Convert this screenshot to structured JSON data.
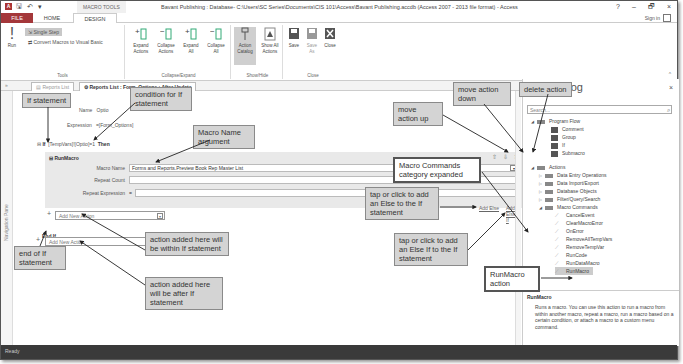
{
  "window": {
    "title": "Bavant Publishing : Database- C:\\Users\\SC Series\\Documents\\CIS 101\\Access\\Bavant Publishing.accdb (Access 2007 - 2013 file format) - Access",
    "context_tab": "MACRO TOOLS",
    "controls": {
      "help": "?",
      "minimize": "–",
      "restore": "🗗",
      "close": "×"
    },
    "sign_in": "Sign in"
  },
  "ribbon": {
    "tabs": [
      "FILE",
      "HOME",
      "DESIGN"
    ],
    "groups": {
      "tools": {
        "label": "Tools",
        "run": "Run",
        "single_step": "Single Step",
        "convert": "Convert Macros to Visual Basic"
      },
      "collapse_expand": {
        "label": "Collapse/Expand",
        "buttons": [
          {
            "line1": "Expand",
            "line2": "Actions"
          },
          {
            "line1": "Collapse",
            "line2": "Actions"
          },
          {
            "line1": "Expand",
            "line2": "All"
          },
          {
            "line1": "Collapse",
            "line2": "All"
          }
        ]
      },
      "show_hide": {
        "label": "Show/Hide",
        "buttons": [
          {
            "line1": "Action",
            "line2": "Catalog"
          },
          {
            "line1": "Show All",
            "line2": "Actions"
          }
        ]
      },
      "close": {
        "label": "Close",
        "buttons": [
          {
            "line1": "Save",
            "line2": ""
          },
          {
            "line1": "Save",
            "line2": "As"
          },
          {
            "line1": "Close",
            "line2": ""
          }
        ]
      }
    }
  },
  "doc_tabs": [
    {
      "label": "Reports List",
      "active": false
    },
    {
      "label": "Reports List : Form_Options : After Update",
      "active": true
    }
  ],
  "nav_pane": {
    "label": "Navigation Pane"
  },
  "designer": {
    "name_label": "Name",
    "name_value": "Optio",
    "expression_label": "Expression",
    "expression_value": "=[Form_Options]",
    "if_keyword": "If",
    "if_condition": "[TempVars]![Optio]=1",
    "then_keyword": "Then",
    "runmacro": {
      "header": "RunMacro",
      "args": [
        {
          "label": "Macro Name",
          "value": "Forms and Reports.Preview Book Rep Master List"
        },
        {
          "label": "Repeat Count",
          "value": ""
        },
        {
          "label": "Repeat Expression",
          "value": "="
        }
      ]
    },
    "add_new_action_inner": "Add New Action",
    "end_if": "End If",
    "add_new_action_outer": "Add New Action",
    "add_else": "Add Else",
    "add_else_if": "Add Else If"
  },
  "catalog": {
    "title": "Catalog",
    "search_placeholder": "Search...",
    "program_flow": {
      "label": "Program Flow",
      "items": [
        "Comment",
        "Group",
        "If",
        "Submacro"
      ]
    },
    "actions": {
      "label": "Actions",
      "categories": [
        "Data Entry Operations",
        "Data Import/Export",
        "Database Objects",
        "Filter/Query/Search"
      ],
      "expanded_category": "Macro Commands",
      "macro_commands": [
        "CancelEvent",
        "ClearMacroError",
        "OnError",
        "RemoveAllTempVars",
        "RemoveTempVar",
        "RunCode",
        "RunDataMacro",
        "RunMacro"
      ]
    },
    "desc_title": "RunMacro",
    "description": "Runs a macro. You can use this action to run a macro from within another macro, repeat a macro, run a macro based on a certain condition, or attach a macro to a custom menu command."
  },
  "status": {
    "text": "Ready"
  },
  "callouts": {
    "if_statement": "If statement",
    "condition": "condition for If statement",
    "macro_name_arg": "Macro Name argument",
    "move_up": "move action up",
    "move_down": "move action down",
    "delete": "delete action",
    "macro_commands": "Macro Commands category expanded",
    "add_else": "tap or click to add an Else to the If statement",
    "add_else_if": "tap or click to add an Else If to the If statement",
    "within_if": "action added here will be within If statement",
    "after_if": "action added here will be after If statement",
    "end_if": "end of If statement",
    "runmacro_action": "RunMacro action"
  },
  "colors": {
    "file_tab": "#a4373a",
    "status_bar": "#3a3a3a",
    "callout_bg": "#d4d4d4"
  }
}
